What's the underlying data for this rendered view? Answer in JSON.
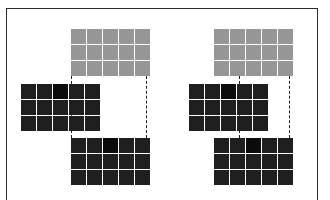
{
  "figure": {
    "title": "",
    "background_color": "#ffffff",
    "frame_color": "#2b2b2b",
    "connector_color": "#1c1c1c",
    "connector_style": "dashed"
  },
  "palette": {
    "gray": "#969696",
    "dark": "#1f1f1f",
    "darker": "#0b0b0b",
    "gap": "#ffffff"
  },
  "chart_data": {
    "type": "heatmap",
    "title": "",
    "xlabel": "",
    "ylabel": "",
    "grid": true,
    "legend": "none",
    "groups": [
      {
        "name": "left-group",
        "grids": [
          {
            "name": "top-gray-grid",
            "shade": "gray",
            "rows": 3,
            "cols": 5,
            "values": [
              [
                1,
                1,
                1,
                1,
                1
              ],
              [
                1,
                1,
                1,
                1,
                1
              ],
              [
                1,
                1,
                1,
                1,
                1
              ]
            ]
          },
          {
            "name": "middle-dark-grid",
            "shade": "dark",
            "rows": 3,
            "cols": 5,
            "values": [
              [
                1,
                1,
                2,
                1,
                1
              ],
              [
                1,
                1,
                1,
                1,
                1
              ],
              [
                1,
                1,
                1,
                1,
                1
              ]
            ]
          },
          {
            "name": "bottom-dark-grid",
            "shade": "dark",
            "rows": 3,
            "cols": 5,
            "values": [
              [
                1,
                1,
                2,
                1,
                1
              ],
              [
                1,
                1,
                1,
                1,
                1
              ],
              [
                1,
                1,
                1,
                1,
                1
              ]
            ]
          }
        ],
        "connectors": [
          {
            "name": "left-connector",
            "x": 70
          },
          {
            "name": "right-connector",
            "x": 145
          }
        ]
      },
      {
        "name": "right-group",
        "grids": [
          {
            "name": "top-gray-grid",
            "shade": "gray",
            "rows": 3,
            "cols": 5,
            "values": [
              [
                1,
                1,
                1,
                1,
                1
              ],
              [
                1,
                1,
                1,
                1,
                1
              ],
              [
                1,
                1,
                1,
                1,
                1
              ]
            ]
          },
          {
            "name": "middle-dark-grid",
            "shade": "dark",
            "rows": 3,
            "cols": 5,
            "values": [
              [
                1,
                1,
                2,
                1,
                1
              ],
              [
                1,
                1,
                1,
                1,
                1
              ],
              [
                1,
                1,
                1,
                1,
                1
              ]
            ]
          },
          {
            "name": "bottom-dark-grid",
            "shade": "dark",
            "rows": 3,
            "cols": 5,
            "values": [
              [
                1,
                1,
                2,
                1,
                1
              ],
              [
                1,
                1,
                1,
                1,
                1
              ],
              [
                1,
                1,
                1,
                1,
                1
              ]
            ]
          }
        ],
        "connectors": [
          {
            "name": "left-connector",
            "x": 238
          },
          {
            "name": "right-connector",
            "x": 288
          }
        ]
      }
    ]
  },
  "layout": {
    "frame": {
      "x": 6,
      "y": 8,
      "w": 312,
      "h": 198
    },
    "cell": {
      "w": 14.5,
      "h": 14.5,
      "gap": 1.5
    },
    "grids": [
      {
        "name": "left-top-gray",
        "x": 70,
        "y": 28,
        "shade": "gray",
        "rows": 3,
        "cols": 5,
        "accent": null
      },
      {
        "name": "left-middle-dark",
        "x": 20,
        "y": 83,
        "shade": "dark",
        "rows": 3,
        "cols": 5,
        "accent": [
          0,
          2
        ]
      },
      {
        "name": "left-bottom-dark",
        "x": 70,
        "y": 137,
        "shade": "dark",
        "rows": 3,
        "cols": 5,
        "accent": [
          0,
          2
        ]
      },
      {
        "name": "right-top-gray",
        "x": 213,
        "y": 28,
        "shade": "gray",
        "rows": 3,
        "cols": 5,
        "accent": null
      },
      {
        "name": "right-middle-dark",
        "x": 188,
        "y": 83,
        "shade": "dark",
        "rows": 3,
        "cols": 5,
        "accent": [
          0,
          2
        ]
      },
      {
        "name": "right-bottom-dark",
        "x": 213,
        "y": 137,
        "shade": "dark",
        "rows": 3,
        "cols": 5,
        "accent": [
          0,
          2
        ]
      }
    ],
    "connectors": [
      {
        "name": "left-group-left-connector",
        "x": 70,
        "y": 75,
        "h": 62
      },
      {
        "name": "left-group-right-connector",
        "x": 145,
        "y": 75,
        "h": 62
      },
      {
        "name": "right-group-left-connector",
        "x": 238,
        "y": 75,
        "h": 62
      },
      {
        "name": "right-group-right-connector",
        "x": 288,
        "y": 75,
        "h": 62
      }
    ]
  }
}
